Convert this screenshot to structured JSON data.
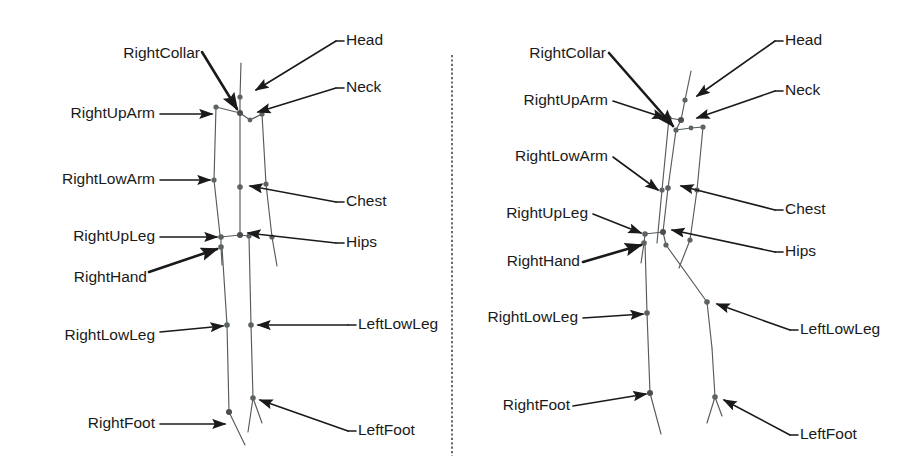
{
  "figure": {
    "caption": "",
    "width": 906,
    "height": 473,
    "background_color": "#ffffff",
    "divider": {
      "style": "vertical-dotted-line",
      "color": "#3a3a3a",
      "x": 452,
      "y_top": 55,
      "y_bottom": 456
    }
  },
  "panels": [
    {
      "id": "left-panel",
      "name": "skeleton-front-view",
      "labels_left": [
        {
          "key": "rightcollar",
          "text": "RightCollar"
        },
        {
          "key": "rightuparm",
          "text": "RightUpArm"
        },
        {
          "key": "rightlowarm",
          "text": "RightLowArm"
        },
        {
          "key": "rightupleg",
          "text": "RightUpLeg"
        },
        {
          "key": "righthand",
          "text": "RightHand"
        },
        {
          "key": "rightlowleg",
          "text": "RightLowLeg"
        },
        {
          "key": "rightfoot",
          "text": "RightFoot"
        }
      ],
      "labels_right": [
        {
          "key": "head",
          "text": "Head"
        },
        {
          "key": "neck",
          "text": "Neck"
        },
        {
          "key": "chest",
          "text": "Chest"
        },
        {
          "key": "hips",
          "text": "Hips"
        },
        {
          "key": "leftlowleg",
          "text": "LeftLowLeg"
        },
        {
          "key": "leftfoot",
          "text": "LeftFoot"
        }
      ]
    },
    {
      "id": "right-panel",
      "name": "skeleton-rotated-view",
      "labels_left": [
        {
          "key": "rightcollar",
          "text": "RightCollar"
        },
        {
          "key": "rightuparm",
          "text": "RightUpArm"
        },
        {
          "key": "rightlowarm",
          "text": "RightLowArm"
        },
        {
          "key": "rightupleg",
          "text": "RightUpLeg"
        },
        {
          "key": "righthand",
          "text": "RightHand"
        },
        {
          "key": "rightlowleg",
          "text": "RightLowLeg"
        },
        {
          "key": "rightfoot",
          "text": "RightFoot"
        }
      ],
      "labels_right": [
        {
          "key": "head",
          "text": "Head"
        },
        {
          "key": "neck",
          "text": "Neck"
        },
        {
          "key": "chest",
          "text": "Chest"
        },
        {
          "key": "hips",
          "text": "Hips"
        },
        {
          "key": "leftlowleg",
          "text": "LeftLowLeg"
        },
        {
          "key": "leftfoot",
          "text": "LeftFoot"
        }
      ]
    }
  ],
  "colors": {
    "text": "#1a1a1a",
    "bone": "#555a5e",
    "joint": "#5d6265",
    "arrow": "#1a1a1a",
    "divider": "#3a3a3a"
  }
}
